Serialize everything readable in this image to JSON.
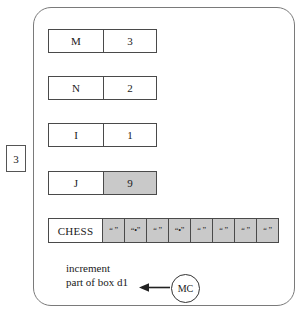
{
  "diagram": {
    "external_box": {
      "label": "3"
    },
    "variables": [
      {
        "name": "M",
        "value": "3",
        "shaded": false
      },
      {
        "name": "N",
        "value": "2",
        "shaded": false
      },
      {
        "name": "I",
        "value": "1",
        "shaded": false
      },
      {
        "name": "J",
        "value": "9",
        "shaded": true
      }
    ],
    "array": {
      "label": "CHESS",
      "cells": [
        {
          "value": "“ ”",
          "shaded": true
        },
        {
          "value": "“•”",
          "shaded": true
        },
        {
          "value": "“ ”",
          "shaded": true
        },
        {
          "value": "“•”",
          "shaded": true
        },
        {
          "value": "“ ”",
          "shaded": true
        },
        {
          "value": "“ ”",
          "shaded": true
        },
        {
          "value": "“ ”",
          "shaded": true
        },
        {
          "value": "“ ”",
          "shaded": true
        }
      ]
    },
    "annotation": {
      "line1": "increment",
      "line2": "part of box d1",
      "marker": "MC"
    }
  }
}
